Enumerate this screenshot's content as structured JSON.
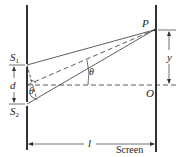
{
  "diagram": {
    "labels": {
      "P": "P",
      "O": "O",
      "S1_main": "S",
      "S1_sub": "1",
      "S2_main": "S",
      "S2_sub": "2",
      "d": "d",
      "y": "y",
      "l": "l",
      "theta_upper": "θ",
      "theta_lower": "θ",
      "screen": "Screen"
    },
    "colors": {
      "line": "#333333",
      "barrier": "#333333"
    }
  }
}
